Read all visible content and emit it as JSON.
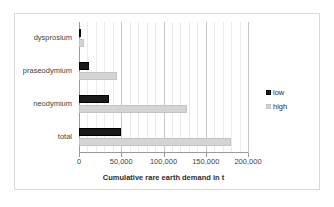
{
  "chart_data": {
    "type": "bar",
    "orientation": "horizontal",
    "title": "",
    "xlabel": "Cumulative rare earth demand in t",
    "ylabel": "",
    "categories": [
      "dysprosium",
      "praseodymium",
      "neodymium",
      "total"
    ],
    "series": [
      {
        "name": "low",
        "color": "#1a1a1a",
        "values": [
          1500,
          12000,
          35000,
          50000
        ]
      },
      {
        "name": "high",
        "color": "#d4d4d4",
        "values": [
          6000,
          45000,
          128000,
          180000
        ]
      }
    ],
    "xlim": [
      0,
      200000
    ],
    "xticks": [
      0,
      50000,
      100000,
      150000,
      200000
    ],
    "xtick_labels": [
      "0",
      "50,000",
      "100,000",
      "150,000",
      "200,000"
    ],
    "minor_tick_step": 10000,
    "grid": "vertical",
    "legend_position": "right",
    "legend": [
      "low",
      "high"
    ]
  },
  "legend": {
    "entries": [
      {
        "label": "low"
      },
      {
        "label": "high"
      }
    ]
  },
  "colors": {
    "low": "#1a1a1a",
    "high": "#d4d4d4",
    "gridline_major": "#c8c8c8",
    "gridline_minor": "#eaeaea",
    "axis": "#9a9a9a",
    "frame": "#d9d9d9",
    "text": "#3f3f3f"
  }
}
